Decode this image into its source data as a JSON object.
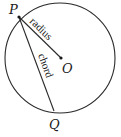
{
  "diagram": {
    "title": "",
    "points": {
      "P": {
        "label": "P",
        "x": 19,
        "y": 17
      },
      "O": {
        "label": "O",
        "x": 61,
        "y": 58
      },
      "Q": {
        "label": "Q",
        "x": 54,
        "y": 111
      }
    },
    "circle": {
      "cx": 60,
      "cy": 58,
      "r": 55
    },
    "segments": [
      {
        "from": "P",
        "to": "O",
        "label": "radius"
      },
      {
        "from": "P",
        "to": "Q",
        "label": "chord"
      }
    ],
    "colors": {
      "stroke": "#2a2a2a",
      "text": "#1a1a1a"
    }
  }
}
